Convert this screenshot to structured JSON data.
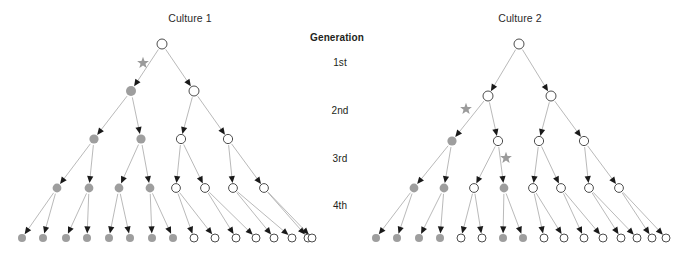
{
  "figure": {
    "width": 675,
    "height": 255,
    "background": "#ffffff"
  },
  "panels": [
    {
      "id": "culture-1",
      "title": "Culture 1",
      "title_x": 190,
      "title_y": 12
    },
    {
      "id": "culture-2",
      "title": "Culture 2",
      "title_x": 520,
      "title_y": 12
    }
  ],
  "generation_axis": {
    "header": "Generation",
    "header_x": 337,
    "header_y": 32,
    "labels": [
      {
        "text": "1st",
        "x": 340,
        "y": 62
      },
      {
        "text": "2nd",
        "x": 340,
        "y": 110
      },
      {
        "text": "3rd",
        "x": 340,
        "y": 158
      },
      {
        "text": "4th",
        "x": 340,
        "y": 205
      }
    ]
  },
  "legend_semantics": {
    "open_circle": "unmutated cell",
    "filled_circle": "mutant cell",
    "star": "mutation event",
    "arrow": "cell division"
  },
  "colors": {
    "filled_node": "#9e9e9e",
    "open_node_stroke": "#4d4d4d",
    "edge": "#9b9b9b",
    "arrowhead": "#1a1a1a",
    "star": "#9b9b9b",
    "text": "#231f20"
  },
  "node_radius": {
    "gen1": 5.0,
    "gen2": 5.0,
    "gen3": 4.6,
    "gen4": 4.4,
    "gen5": 4.0
  },
  "chart_data": {
    "type": "diagram",
    "subtype": "binary-lineage-tree",
    "row_y": [
      44,
      91,
      139,
      188,
      238
    ],
    "row_generation_labels": [
      "1st",
      "2nd",
      "3rd",
      "4th",
      ""
    ],
    "trees": [
      {
        "name": "Culture 1",
        "mutant_count_final": 8,
        "total_final": 16,
        "levels": [
          {
            "generation": "1st",
            "y": 44,
            "nodes": [
              {
                "x": 162,
                "state": "open"
              }
            ]
          },
          {
            "generation": "2nd",
            "y": 91,
            "nodes": [
              {
                "x": 131,
                "state": "filled"
              },
              {
                "x": 194,
                "state": "open"
              }
            ]
          },
          {
            "generation": "3rd",
            "y": 139,
            "nodes": [
              {
                "x": 94,
                "state": "filled"
              },
              {
                "x": 141,
                "state": "filled"
              },
              {
                "x": 181,
                "state": "open"
              },
              {
                "x": 228,
                "state": "open"
              }
            ]
          },
          {
            "generation": "4th",
            "y": 188,
            "nodes": [
              {
                "x": 57,
                "state": "filled"
              },
              {
                "x": 89,
                "state": "filled"
              },
              {
                "x": 119,
                "state": "filled"
              },
              {
                "x": 150,
                "state": "filled"
              },
              {
                "x": 176,
                "state": "open"
              },
              {
                "x": 205,
                "state": "open"
              },
              {
                "x": 233,
                "state": "open"
              },
              {
                "x": 264,
                "state": "open"
              }
            ]
          },
          {
            "generation": "",
            "y": 238,
            "nodes": [
              {
                "x": 22,
                "state": "filled"
              },
              {
                "x": 43,
                "state": "filled"
              },
              {
                "x": 66,
                "state": "filled"
              },
              {
                "x": 87,
                "state": "filled"
              },
              {
                "x": 109,
                "state": "filled"
              },
              {
                "x": 130,
                "state": "filled"
              },
              {
                "x": 152,
                "state": "filled"
              },
              {
                "x": 173,
                "state": "filled"
              },
              {
                "x": 194,
                "state": "open"
              },
              {
                "x": 215,
                "state": "open"
              },
              {
                "x": 236,
                "state": "open"
              },
              {
                "x": 256,
                "state": "open"
              },
              {
                "x": 274,
                "state": "open"
              },
              {
                "x": 292,
                "state": "open"
              },
              {
                "x": 308,
                "state": "open"
              },
              {
                "x": 312,
                "state": "open"
              }
            ]
          }
        ],
        "stars": [
          {
            "x": 143,
            "y": 63
          }
        ]
      },
      {
        "name": "Culture 2",
        "mutant_count_final": 6,
        "total_final": 16,
        "levels": [
          {
            "generation": "1st",
            "y": 44,
            "nodes": [
              {
                "x": 519,
                "state": "open"
              }
            ]
          },
          {
            "generation": "2nd",
            "y": 96,
            "nodes": [
              {
                "x": 488,
                "state": "open"
              },
              {
                "x": 551,
                "state": "open"
              }
            ]
          },
          {
            "generation": "3rd",
            "y": 141,
            "nodes": [
              {
                "x": 452,
                "state": "filled"
              },
              {
                "x": 498,
                "state": "open"
              },
              {
                "x": 539,
                "state": "open"
              },
              {
                "x": 584,
                "state": "open"
              }
            ]
          },
          {
            "generation": "4th",
            "y": 188,
            "nodes": [
              {
                "x": 414,
                "state": "filled"
              },
              {
                "x": 444,
                "state": "filled"
              },
              {
                "x": 474,
                "state": "open"
              },
              {
                "x": 504,
                "state": "filled"
              },
              {
                "x": 533,
                "state": "open"
              },
              {
                "x": 561,
                "state": "open"
              },
              {
                "x": 589,
                "state": "open"
              },
              {
                "x": 619,
                "state": "open"
              }
            ]
          },
          {
            "generation": "",
            "y": 238,
            "nodes": [
              {
                "x": 376,
                "state": "filled"
              },
              {
                "x": 397,
                "state": "filled"
              },
              {
                "x": 419,
                "state": "filled"
              },
              {
                "x": 440,
                "state": "filled"
              },
              {
                "x": 461,
                "state": "open"
              },
              {
                "x": 482,
                "state": "open"
              },
              {
                "x": 503,
                "state": "filled"
              },
              {
                "x": 523,
                "state": "filled"
              },
              {
                "x": 544,
                "state": "open"
              },
              {
                "x": 564,
                "state": "open"
              },
              {
                "x": 584,
                "state": "open"
              },
              {
                "x": 603,
                "state": "open"
              },
              {
                "x": 621,
                "state": "open"
              },
              {
                "x": 637,
                "state": "open"
              },
              {
                "x": 652,
                "state": "open"
              },
              {
                "x": 666,
                "state": "open"
              }
            ]
          }
        ],
        "stars": [
          {
            "x": 466,
            "y": 109
          },
          {
            "x": 506,
            "y": 158
          }
        ]
      }
    ]
  }
}
